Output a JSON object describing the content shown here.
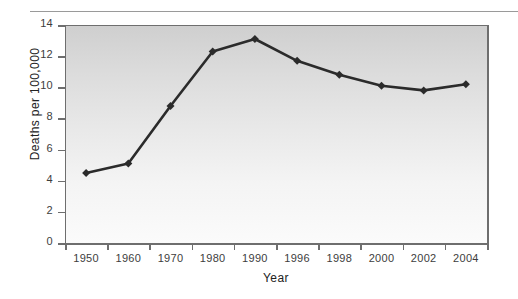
{
  "chart_data": {
    "type": "line",
    "title": "",
    "xlabel": "Year",
    "ylabel": "Deaths per 100,000",
    "categories": [
      "1950",
      "1960",
      "1970",
      "1980",
      "1990",
      "1996",
      "1998",
      "2000",
      "2002",
      "2004"
    ],
    "values": [
      4.5,
      5.1,
      8.8,
      12.3,
      13.1,
      11.7,
      10.8,
      10.1,
      9.8,
      10.2
    ],
    "series": [
      {
        "name": "Deaths per 100,000",
        "values": [
          4.5,
          5.1,
          8.8,
          12.3,
          13.1,
          11.7,
          10.8,
          10.1,
          9.8,
          10.2
        ]
      }
    ],
    "ylim": [
      0,
      14
    ],
    "y_ticks": [
      "0",
      "2",
      "4",
      "6",
      "8",
      "10",
      "12",
      "14"
    ],
    "y_tick_values": [
      0,
      2,
      4,
      6,
      8,
      10,
      12,
      14
    ],
    "x_tick_labels": [
      "1950",
      "1960",
      "1970",
      "1980",
      "1990",
      "1996",
      "1998",
      "2000",
      "2002",
      "2004"
    ],
    "grid": false,
    "legend": false,
    "legend_position": "none",
    "marker": "diamond",
    "line_color": "#2b2b2b",
    "marker_color": "#2b2b2b",
    "plot_background_top_color": "#cfcfcf",
    "plot_background_bottom_color": "#fbfbfb",
    "axis_color": "#6e6e6e",
    "text_color": "#3d3d3d"
  }
}
